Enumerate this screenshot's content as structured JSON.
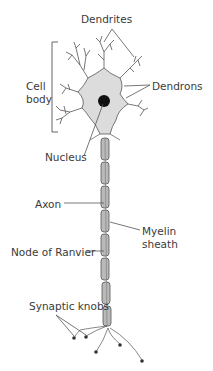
{
  "labels": {
    "dendrites": "Dendrites",
    "cell_body_line1": "Cell",
    "cell_body_line2": "body",
    "dendrons": "Dendrons",
    "nucleus": "Nucleus",
    "axon": "Axon",
    "myelin_line1": "Myelin",
    "myelin_line2": "sheath",
    "node_of_ranvier": "Node of Ranvier",
    "synaptic_knobs": "Synaptic knobs"
  },
  "colors": {
    "cell_fill": "#dcdcdc",
    "outline": "#555555",
    "nucleus": "#111111",
    "myelin_fill": "#b9b9b9",
    "text": "#3a3a3a",
    "leader": "#555555"
  }
}
